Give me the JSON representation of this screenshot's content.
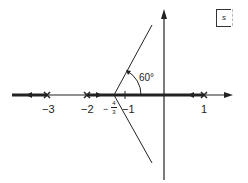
{
  "diagram": {
    "type": "root-locus",
    "plane_label": "s",
    "angle_label": "60°",
    "axis_ticks": [
      {
        "value": -3,
        "label": "−3"
      },
      {
        "value": -2,
        "label": "−2"
      },
      {
        "value": -1,
        "label": "−1"
      },
      {
        "value": 1,
        "label": "1"
      }
    ],
    "centroid": {
      "value": -1.3333,
      "label_prefix": "−",
      "label_num": "4",
      "label_den": "3"
    },
    "poles": [
      -3,
      -2,
      1
    ],
    "asymptote_angles_deg": [
      60,
      180,
      300
    ],
    "colors": {
      "line": "#222222"
    }
  }
}
